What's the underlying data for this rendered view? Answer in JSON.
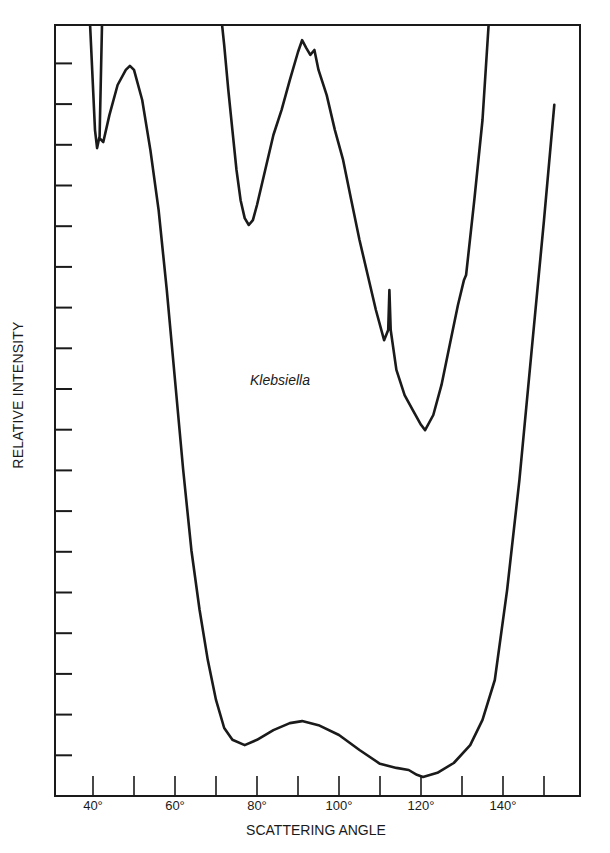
{
  "chart_data": {
    "type": "line",
    "title": "",
    "annotation": "Klebsiella",
    "xlabel": "SCATTERING ANGLE",
    "ylabel": "RELATIVE INTENSITY",
    "xlim": [
      35,
      160
    ],
    "ylim": [
      0,
      18.95
    ],
    "x_unit": "degrees",
    "xticks": [
      40,
      50,
      60,
      70,
      80,
      90,
      100,
      110,
      120,
      130,
      140,
      150
    ],
    "xtick_labels": [
      "40°",
      "",
      "60°",
      "",
      "80°",
      "",
      "100°",
      "",
      "120°",
      "",
      "140°",
      ""
    ],
    "yticks": [
      1,
      2,
      3,
      4,
      5,
      6,
      7,
      8,
      9,
      10,
      11,
      12,
      13,
      14,
      15,
      16,
      17,
      18
    ],
    "ytick_labels": [],
    "grid": false,
    "legend": null,
    "series": [
      {
        "name": "Lower-gain trace",
        "color": "#1a1a1a",
        "x": [
          39.3,
          40.5,
          41.0,
          41.5,
          42.5,
          44,
          46,
          48,
          49,
          50,
          52,
          54,
          56,
          58,
          60,
          62,
          64,
          66,
          68,
          70,
          72,
          74,
          77,
          80,
          84,
          88,
          91,
          95,
          100,
          105,
          110,
          114,
          117,
          119,
          120.5,
          124,
          128,
          132,
          135,
          138,
          141,
          144,
          147,
          150,
          152.5
        ],
        "y": [
          18.94,
          16.36,
          15.92,
          16.17,
          16.07,
          16.73,
          17.47,
          17.84,
          17.94,
          17.84,
          17.1,
          15.87,
          14.4,
          12.43,
          10.22,
          8.01,
          6.04,
          4.57,
          3.34,
          2.36,
          1.67,
          1.38,
          1.25,
          1.38,
          1.62,
          1.79,
          1.84,
          1.74,
          1.5,
          1.13,
          0.79,
          0.69,
          0.64,
          0.52,
          0.47,
          0.57,
          0.81,
          1.25,
          1.87,
          2.85,
          5.06,
          7.76,
          10.96,
          14.15,
          16.98
        ]
      },
      {
        "name": "Higher-gain trace (left spike)",
        "color": "#1a1a1a",
        "x": [
          41.6,
          42.2
        ],
        "y": [
          16.2,
          18.94
        ]
      },
      {
        "name": "Higher-gain trace",
        "color": "#1a1a1a",
        "x": [
          71.5,
          72,
          73,
          74,
          75,
          76,
          77,
          78,
          79,
          80,
          82,
          84,
          86,
          88,
          90,
          91,
          92,
          93,
          94,
          95,
          97,
          99,
          101,
          103,
          105,
          107,
          109,
          111,
          112,
          112.3,
          112.6,
          114,
          116,
          118,
          120,
          121,
          123,
          125,
          127,
          129,
          130.5,
          131,
          133,
          135,
          136.5
        ],
        "y": [
          18.94,
          18.45,
          17.35,
          16.36,
          15.38,
          14.64,
          14.2,
          14.03,
          14.15,
          14.52,
          15.38,
          16.24,
          16.86,
          17.59,
          18.28,
          18.57,
          18.38,
          18.21,
          18.33,
          17.84,
          17.22,
          16.36,
          15.63,
          14.64,
          13.66,
          12.8,
          11.94,
          11.2,
          11.45,
          12.43,
          11.45,
          10.47,
          9.85,
          9.48,
          9.12,
          8.99,
          9.36,
          10.1,
          11.08,
          12.06,
          12.68,
          12.8,
          14.64,
          16.61,
          18.94
        ]
      }
    ]
  },
  "layout": {
    "plot_left_px": 55,
    "plot_right_px": 580,
    "plot_top_px": 25,
    "plot_bottom_px": 796,
    "x0_angle": 40,
    "x0_px": 93,
    "px_per_degree": 4.1,
    "px_per_unit": 40.7,
    "ink_color": "#1a1a1a",
    "background": "#ffffff"
  }
}
